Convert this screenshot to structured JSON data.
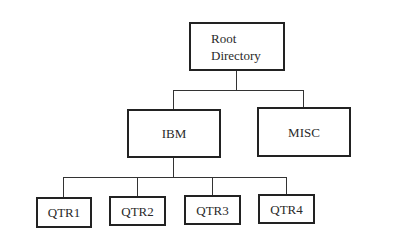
{
  "diagram": {
    "type": "directory-tree",
    "root": {
      "label_line1": "Root",
      "label_line2": "Directory",
      "children": [
        "IBM",
        "MISC"
      ]
    },
    "level1": [
      {
        "label": "IBM",
        "children": [
          "QTR1",
          "QTR2",
          "QTR3",
          "QTR4"
        ]
      },
      {
        "label": "MISC",
        "children": []
      }
    ],
    "level2": [
      {
        "label": "QTR1"
      },
      {
        "label": "QTR2"
      },
      {
        "label": "QTR3"
      },
      {
        "label": "QTR4"
      }
    ],
    "colors": {
      "border": "#222222",
      "line": "#333333",
      "text": "#2a2a2a",
      "background": "#ffffff"
    }
  }
}
